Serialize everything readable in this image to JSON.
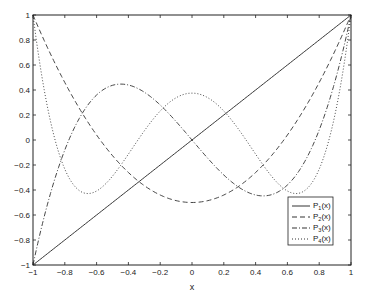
{
  "chart_data": {
    "type": "line",
    "title": "",
    "xlabel": "x",
    "ylabel": "",
    "xlim": [
      -1,
      1
    ],
    "ylim": [
      -1,
      1
    ],
    "grid": false,
    "legend_position": "lower right",
    "x_ticks": [
      "-1",
      "-0.8",
      "-0.6",
      "-0.4",
      "-0.2",
      "0",
      "0.2",
      "0.4",
      "0.6",
      "0.8",
      "1"
    ],
    "y_ticks": [
      "-1",
      "-0.8",
      "-0.6",
      "-0.4",
      "-0.2",
      "0",
      "0.2",
      "0.4",
      "0.6",
      "0.8",
      "1"
    ],
    "x": [
      -1,
      -0.9,
      -0.8,
      -0.7,
      -0.6,
      -0.5,
      -0.4,
      -0.3,
      -0.2,
      -0.1,
      0,
      0.1,
      0.2,
      0.3,
      0.4,
      0.5,
      0.6,
      0.7,
      0.8,
      0.9,
      1
    ],
    "series": [
      {
        "name": "P1(x)",
        "sub": "1",
        "style": "solid",
        "values": [
          -1,
          -0.9,
          -0.8,
          -0.7,
          -0.6,
          -0.5,
          -0.4,
          -0.3,
          -0.2,
          -0.1,
          0,
          0.1,
          0.2,
          0.3,
          0.4,
          0.5,
          0.6,
          0.7,
          0.8,
          0.9,
          1
        ]
      },
      {
        "name": "P2(x)",
        "sub": "2",
        "style": "dashed",
        "values": [
          1,
          0.715,
          0.46,
          0.235,
          0.04,
          -0.125,
          -0.26,
          -0.365,
          -0.44,
          -0.485,
          -0.5,
          -0.485,
          -0.44,
          -0.365,
          -0.26,
          -0.125,
          0.04,
          0.235,
          0.46,
          0.715,
          1
        ]
      },
      {
        "name": "P3(x)",
        "sub": "3",
        "style": "dashdot",
        "values": [
          -1,
          -0.4725,
          -0.08,
          0.1925,
          0.36,
          0.4375,
          0.44,
          0.3825,
          0.28,
          0.1475,
          0,
          -0.1475,
          -0.28,
          -0.3825,
          -0.44,
          -0.4375,
          -0.36,
          -0.1925,
          0.08,
          0.4725,
          1
        ]
      },
      {
        "name": "P4(x)",
        "sub": "4",
        "style": "dotted",
        "values": [
          1,
          0.2079,
          -0.233,
          -0.4121,
          -0.408,
          -0.2891,
          -0.113,
          0.0729,
          0.232,
          0.3379,
          0.375,
          0.3379,
          0.232,
          0.0729,
          -0.113,
          -0.2891,
          -0.408,
          -0.4121,
          -0.233,
          0.2079,
          1
        ]
      }
    ]
  },
  "legend": {
    "items": [
      {
        "prefix": "P",
        "sub": "1",
        "suffix": "(x)"
      },
      {
        "prefix": "P",
        "sub": "2",
        "suffix": "(x)"
      },
      {
        "prefix": "P",
        "sub": "3",
        "suffix": "(x)"
      },
      {
        "prefix": "P",
        "sub": "4",
        "suffix": "(x)"
      }
    ]
  },
  "axes": {
    "xlabel": "x"
  }
}
